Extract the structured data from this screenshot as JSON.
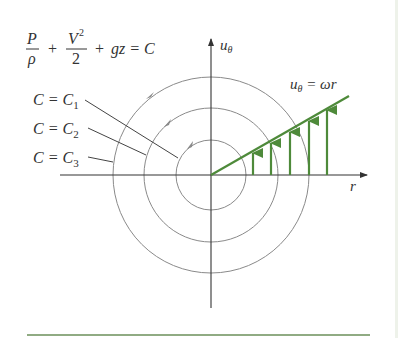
{
  "figure": {
    "equation": {
      "frac1_num": "P",
      "frac1_den": "ρ",
      "plus1": "+",
      "frac2_num": "V",
      "frac2_exp": "2",
      "frac2_den": "2",
      "plus2": "+",
      "tail": "gz = C"
    },
    "streamline_labels": [
      {
        "lhs": "C = C",
        "sub": "1"
      },
      {
        "lhs": "C = C",
        "sub": "2"
      },
      {
        "lhs": "C = C",
        "sub": "3"
      }
    ],
    "axes": {
      "vertical_label": "u",
      "vertical_label_sub": "θ",
      "horizontal_label": "r"
    },
    "profile_label": {
      "lhs": "u",
      "lhs_sub": "θ",
      "rhs": " = ωr"
    },
    "colors": {
      "green": "#4e8a3a",
      "circle_gray": "#8a8a8a",
      "axis_black": "#333333",
      "rule_green": "#6b8f5a"
    }
  }
}
